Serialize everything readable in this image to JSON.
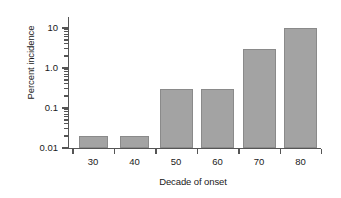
{
  "chart_data": {
    "type": "bar",
    "title": "",
    "xlabel": "Decade of onset",
    "ylabel": "Percent incidence",
    "categories": [
      "30",
      "40",
      "50",
      "60",
      "70",
      "80"
    ],
    "values": [
      0.02,
      0.02,
      0.3,
      0.3,
      3,
      10
    ],
    "yscale": "log",
    "ylim": [
      0.01,
      10
    ],
    "ytick_labels": [
      "10",
      "1.0",
      "0.1",
      "0.01"
    ],
    "ytick_values": [
      10,
      1.0,
      0.1,
      0.01
    ],
    "yminor_ticks": true,
    "grid": false,
    "legend": false,
    "bar_color": "#a3a3a3",
    "bar_edge_color": "#8a8a8a",
    "axis_color": "#555555",
    "background": "#ffffff",
    "series": [
      {
        "name": "Percent incidence",
        "values": [
          0.02,
          0.02,
          0.3,
          0.3,
          3,
          10
        ]
      }
    ]
  }
}
